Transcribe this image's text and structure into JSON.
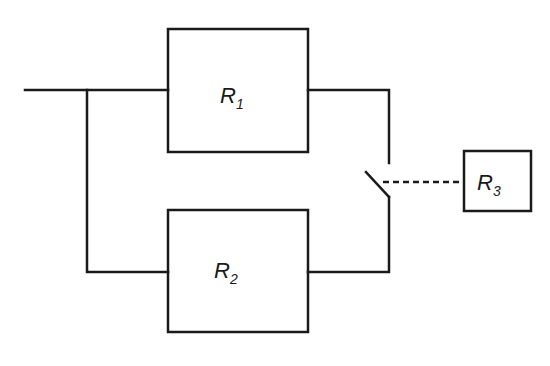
{
  "diagram": {
    "type": "block circuit",
    "colors": {
      "line": "#1a1a1a",
      "background": "#ffffff"
    },
    "blocks": [
      {
        "id": "R1",
        "label": "R",
        "subscript": "1"
      },
      {
        "id": "R2",
        "label": "R",
        "subscript": "2"
      },
      {
        "id": "R3",
        "label": "R",
        "subscript": "3"
      }
    ],
    "connections": [
      {
        "from": "input",
        "to": "R1",
        "style": "solid"
      },
      {
        "from": "input",
        "to": "R2",
        "style": "solid"
      },
      {
        "from": "R1",
        "to": "switch",
        "style": "solid"
      },
      {
        "from": "R2",
        "to": "switch",
        "style": "solid"
      },
      {
        "from": "switch",
        "to": "R3",
        "style": "dashed"
      }
    ]
  }
}
